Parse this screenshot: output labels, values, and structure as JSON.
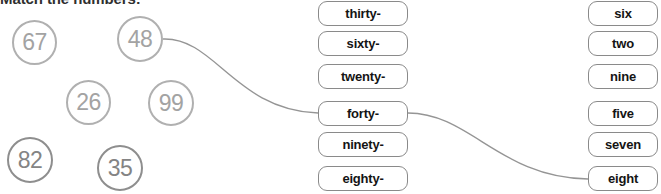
{
  "page": {
    "title": "Match the numbers:",
    "background_color": "#ffffff"
  },
  "colors": {
    "circle_stroke_light": "#b0b0b0",
    "circle_text_light": "#a3a3a3",
    "circle_stroke_dark": "#8e8e8e",
    "circle_text_dark": "#848484",
    "button_border": "#8a8a8a",
    "button_text": "#141414",
    "connector_line": "#959595",
    "title_text": "#2f2f2f"
  },
  "numbers": [
    {
      "value": "67",
      "x": 12,
      "y": 20,
      "size": 45,
      "shade": "light"
    },
    {
      "value": "48",
      "x": 117,
      "y": 16,
      "size": 46,
      "shade": "light"
    },
    {
      "value": "26",
      "x": 66,
      "y": 80,
      "size": 45,
      "shade": "light"
    },
    {
      "value": "99",
      "x": 148,
      "y": 80,
      "size": 46,
      "shade": "light"
    },
    {
      "value": "82",
      "x": 7,
      "y": 137,
      "size": 46,
      "shade": "dark"
    },
    {
      "value": "35",
      "x": 97,
      "y": 145,
      "size": 46,
      "shade": "dark"
    }
  ],
  "prefix_options": [
    {
      "label": "thirty-",
      "y": 1
    },
    {
      "label": "sixty-",
      "y": 31
    },
    {
      "label": "twenty-",
      "y": 64
    },
    {
      "label": "forty-",
      "y": 101
    },
    {
      "label": "ninety-",
      "y": 132
    },
    {
      "label": "eighty-",
      "y": 166
    }
  ],
  "suffix_options": [
    {
      "label": "six",
      "y": 1
    },
    {
      "label": "two",
      "y": 31
    },
    {
      "label": "nine",
      "y": 64
    },
    {
      "label": "five",
      "y": 101
    },
    {
      "label": "seven",
      "y": 132
    },
    {
      "label": "eight",
      "y": 166
    }
  ],
  "connections": [
    {
      "from": "48",
      "to": "forty-",
      "path": "M 163,39 C 215,37 235,110 318,113"
    },
    {
      "from": "forty-",
      "to": "eight",
      "path": "M 408,113 C 470,113 500,178 588,179"
    }
  ]
}
